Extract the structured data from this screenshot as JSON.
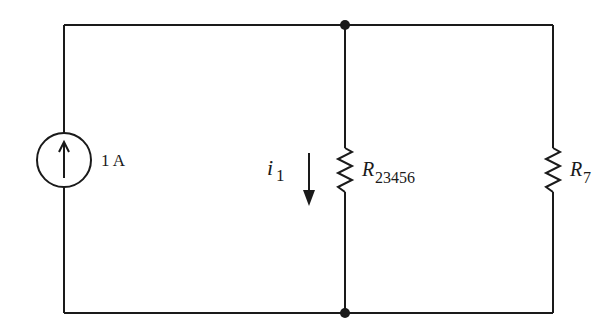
{
  "diagram": {
    "type": "circuit",
    "source": {
      "kind": "current-source",
      "direction": "up",
      "label": "1 A"
    },
    "current": {
      "symbol": "i",
      "subscript": "1",
      "direction": "down"
    },
    "resistors": [
      {
        "symbol": "R",
        "subscript": "23456"
      },
      {
        "symbol": "R",
        "subscript": "7"
      }
    ],
    "nodes": [
      {
        "position": "top"
      },
      {
        "position": "bottom"
      }
    ],
    "colors": {
      "wire": "#1a1a1a",
      "background": "#ffffff"
    }
  }
}
